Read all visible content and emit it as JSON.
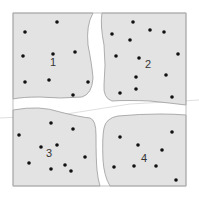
{
  "diagram": {
    "type": "cracked-plate",
    "colors": {
      "region_fill": "#e3e3e3",
      "region_stroke": "#9a9a9a",
      "dot": "#111111",
      "label": "#333333",
      "background": "#ffffff"
    },
    "regions": [
      {
        "label": "1",
        "label_pos": [
          53,
          66
        ],
        "dots": [
          [
            57,
            22
          ],
          [
            25,
            32
          ],
          [
            23,
            56
          ],
          [
            53,
            54
          ],
          [
            75,
            52
          ],
          [
            25,
            82
          ],
          [
            49,
            80
          ],
          [
            88,
            82
          ],
          [
            73,
            95
          ]
        ]
      },
      {
        "label": "2",
        "label_pos": [
          148,
          68
        ],
        "dots": [
          [
            133,
            22
          ],
          [
            112,
            34
          ],
          [
            150,
            30
          ],
          [
            164,
            32
          ],
          [
            130,
            40
          ],
          [
            116,
            56
          ],
          [
            139,
            58
          ],
          [
            178,
            54
          ],
          [
            166,
            75
          ],
          [
            136,
            77
          ],
          [
            136,
            89
          ],
          [
            120,
            93
          ],
          [
            172,
            97
          ]
        ]
      },
      {
        "label": "3",
        "label_pos": [
          49,
          157
        ],
        "dots": [
          [
            51,
            123
          ],
          [
            19,
            135
          ],
          [
            73,
            129
          ],
          [
            41,
            147
          ],
          [
            57,
            145
          ],
          [
            29,
            163
          ],
          [
            51,
            169
          ],
          [
            65,
            165
          ],
          [
            71,
            171
          ],
          [
            85,
            157
          ]
        ]
      },
      {
        "label": "4",
        "label_pos": [
          144,
          162
        ],
        "dots": [
          [
            120,
            137
          ],
          [
            172,
            132
          ],
          [
            138,
            145
          ],
          [
            162,
            150
          ],
          [
            114,
            167
          ],
          [
            134,
            166
          ],
          [
            156,
            166
          ],
          [
            176,
            180
          ]
        ]
      }
    ]
  }
}
